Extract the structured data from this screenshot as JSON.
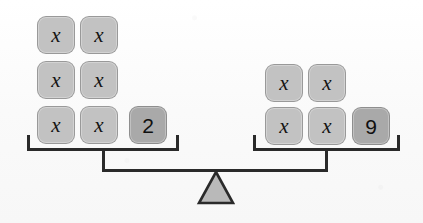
{
  "diagram": {
    "equation": "6x + 2 = 4x + 9",
    "variable_symbol": "x",
    "colors": {
      "background": "#fbfbfb",
      "variable_tile": "#c2c2c2",
      "number_tile": "#a9a9a9",
      "tile_border": "#787878",
      "tile_text": "#141414",
      "beam": "#2a2a2a",
      "fulcrum_fill": "#b9b9b9",
      "fulcrum_stroke": "#2a2a2a"
    }
  },
  "left_pan": {
    "name": "left-pan",
    "variable_count": 6,
    "constant_value": "2",
    "expression": "6x + 2",
    "rows": [
      {
        "tiles": [
          {
            "type": "variable",
            "label": "x"
          },
          {
            "type": "variable",
            "label": "x"
          }
        ]
      },
      {
        "tiles": [
          {
            "type": "variable",
            "label": "x"
          },
          {
            "type": "variable",
            "label": "x"
          }
        ]
      },
      {
        "tiles": [
          {
            "type": "variable",
            "label": "x"
          },
          {
            "type": "variable",
            "label": "x"
          },
          {
            "type": "number",
            "label": "2"
          }
        ]
      }
    ]
  },
  "right_pan": {
    "name": "right-pan",
    "variable_count": 4,
    "constant_value": "9",
    "expression": "4x + 9",
    "rows": [
      {
        "tiles": [
          {
            "type": "variable",
            "label": "x"
          },
          {
            "type": "variable",
            "label": "x"
          }
        ]
      },
      {
        "tiles": [
          {
            "type": "variable",
            "label": "x"
          },
          {
            "type": "variable",
            "label": "x"
          },
          {
            "type": "number",
            "label": "9"
          }
        ]
      }
    ]
  },
  "fulcrum": {
    "name": "fulcrum-triangle",
    "shape": "triangle"
  }
}
